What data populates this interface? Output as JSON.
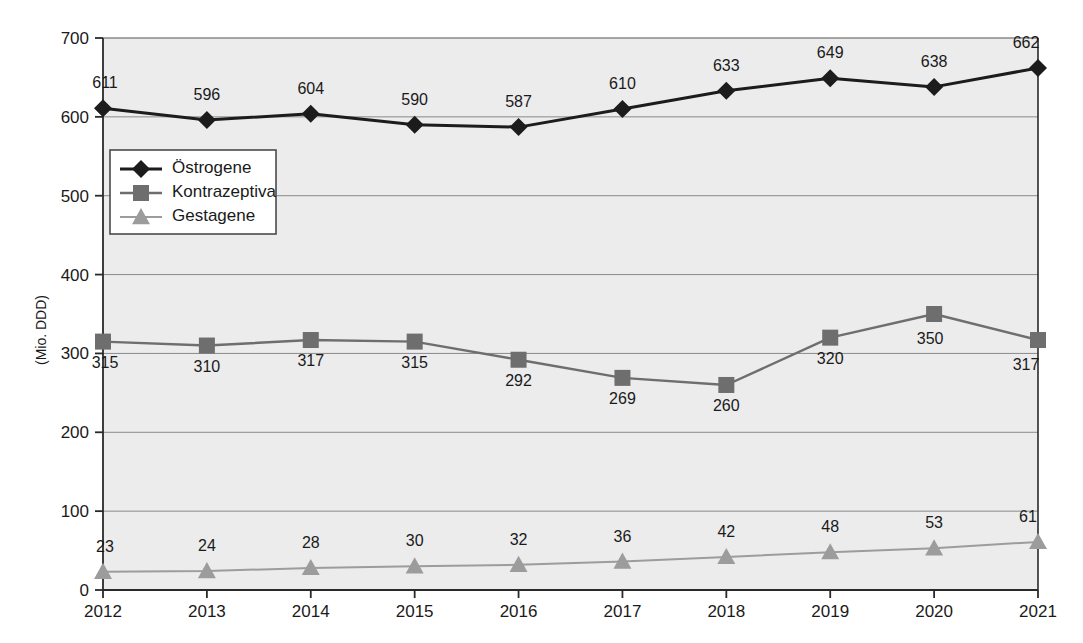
{
  "chart_data": {
    "type": "line",
    "title": "",
    "subtitle": "",
    "xlabel": "",
    "ylabel": "(Mio. DDD)",
    "categories": [
      "2012",
      "2013",
      "2014",
      "2015",
      "2016",
      "2017",
      "2018",
      "2019",
      "2020",
      "2021"
    ],
    "x": [
      2012,
      2013,
      2014,
      2015,
      2016,
      2017,
      2018,
      2019,
      2020,
      2021
    ],
    "ylim": [
      0,
      700
    ],
    "yticks": [
      0,
      100,
      200,
      300,
      400,
      500,
      600,
      700
    ],
    "ytick_labels": [
      "0",
      "100",
      "200",
      "300",
      "400",
      "500",
      "600",
      "700"
    ],
    "grid": "horizontal",
    "legend_position": "upper-left-inside",
    "series": [
      {
        "name": "Östrogene",
        "marker": "diamond",
        "color": "#1c1c1c",
        "values": [
          611,
          596,
          604,
          590,
          587,
          610,
          633,
          649,
          638,
          662
        ],
        "labels": [
          "611",
          "596",
          "604",
          "590",
          "587",
          "610",
          "633",
          "649",
          "638",
          "662"
        ]
      },
      {
        "name": "Kontrazeptiva",
        "marker": "square",
        "color": "#6e6e6e",
        "values": [
          315,
          310,
          317,
          315,
          292,
          269,
          260,
          320,
          350,
          317
        ],
        "labels": [
          "315",
          "310",
          "317",
          "315",
          "292",
          "269",
          "260",
          "320",
          "350",
          "317"
        ]
      },
      {
        "name": "Gestagene",
        "marker": "triangle",
        "color": "#9c9c9c",
        "values": [
          23,
          24,
          28,
          30,
          32,
          36,
          42,
          48,
          53,
          61
        ],
        "labels": [
          "23",
          "24",
          "28",
          "30",
          "32",
          "36",
          "42",
          "48",
          "53",
          "61"
        ]
      }
    ],
    "colors": {
      "plot_background": "#ececed",
      "gridline": "#8a8a8a",
      "axis": "#2a2a2a",
      "estrogene": "#1c1c1c",
      "kontrazeptiva": "#6e6e6e",
      "gestagene": "#9c9c9c",
      "legend_background": "#ffffff",
      "legend_border": "#4a4a4a"
    }
  }
}
